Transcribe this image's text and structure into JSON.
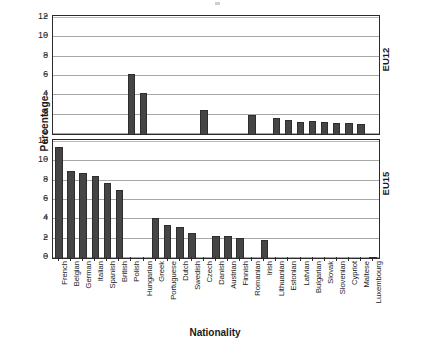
{
  "axes": {
    "ylabel": "Percentage",
    "xlabel": "Nationality",
    "yticks": [
      "12",
      "10",
      "8",
      "6",
      "4",
      "2",
      "0"
    ]
  },
  "panels": {
    "top_tag": "EU12",
    "bottom_tag": "EU15"
  },
  "chart_data": {
    "type": "bar",
    "title": "",
    "xlabel": "Nationality",
    "ylabel": "Percentage",
    "ylim": [
      0,
      12
    ],
    "yticks": [
      0,
      2,
      4,
      6,
      8,
      10,
      12
    ],
    "grid": true,
    "legend": false,
    "orientation": "vertical",
    "bar_color": "#454545",
    "categories": [
      "French",
      "Belgian",
      "German",
      "Italian",
      "Spanish",
      "British",
      "Polish",
      "Hungarian",
      "Greek",
      "Portuguese",
      "Dutch",
      "Swedish",
      "Czech",
      "Danish",
      "Austrian",
      "Finnish",
      "Romanian",
      "Irish",
      "Lithuanian",
      "Estonian",
      "Latvian",
      "Bulgarian",
      "Slovak",
      "Slovenian",
      "Cypriot",
      "Maltese",
      "Luxembourg"
    ],
    "series": [
      {
        "name": "EU12",
        "panel": "top",
        "values": [
          0,
          0,
          0,
          0,
          0,
          0,
          6.2,
          4.2,
          0,
          0,
          0,
          0,
          2.5,
          0,
          0,
          0,
          2.0,
          0,
          1.7,
          1.5,
          1.25,
          1.3,
          1.2,
          1.15,
          1.1,
          1.0,
          0
        ]
      },
      {
        "name": "EU15",
        "panel": "bottom",
        "values": [
          11.5,
          9.0,
          8.8,
          8.5,
          7.8,
          7.0,
          0,
          0,
          4.1,
          3.4,
          3.2,
          2.6,
          0,
          2.3,
          2.25,
          2.1,
          0,
          1.9,
          0,
          0,
          0,
          0,
          0,
          0,
          0,
          0,
          0.15
        ]
      }
    ]
  }
}
